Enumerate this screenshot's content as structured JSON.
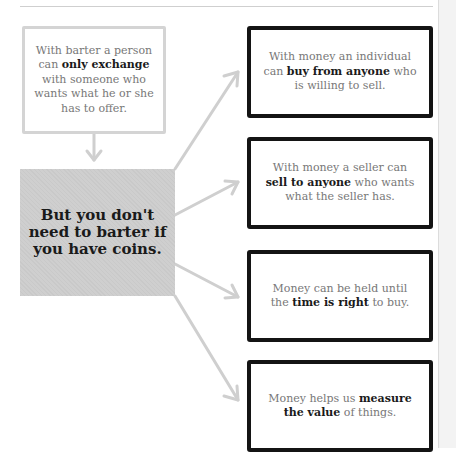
{
  "diagram": {
    "barter_box": {
      "pre": "With barter a person can ",
      "bold": "only exchange",
      "post": " with someone who wants what he or she has to offer."
    },
    "coins_box": {
      "text": "But you don't need to barter if you have coins."
    },
    "money_boxes": [
      {
        "pre": "With money an individual can ",
        "bold": "buy from anyone",
        "post": " who is willing to sell."
      },
      {
        "pre": "With money a seller can ",
        "bold": "sell to anyone",
        "post": " who wants what the seller has."
      },
      {
        "pre": "Money can be held until the ",
        "bold": "time is right",
        "post": " to buy."
      },
      {
        "pre": "Money helps us ",
        "bold": "measure the value",
        "post": " of things."
      }
    ],
    "colors": {
      "arrow": "#cfcfcf",
      "box_border_dark": "#141414",
      "box_border_light": "#d4d4d4",
      "highlight_fill": "#cccccc",
      "body_text": "#777777",
      "bold_text": "#1a1a1a"
    }
  }
}
